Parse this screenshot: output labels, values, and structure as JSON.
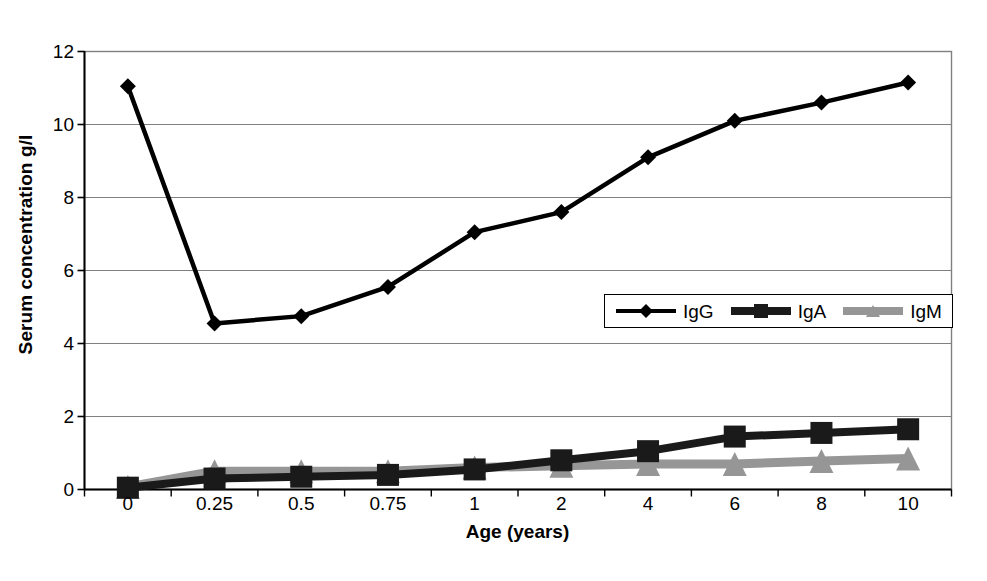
{
  "chart_data": {
    "type": "line",
    "title": "",
    "xlabel": "Age (years)",
    "ylabel": "Serum concentration g/l",
    "categories": [
      "0",
      "0.25",
      "0.5",
      "0.75",
      "1",
      "2",
      "4",
      "6",
      "8",
      "10"
    ],
    "ylim": [
      0,
      12
    ],
    "yticks": [
      "0",
      "2",
      "4",
      "6",
      "8",
      "10",
      "12"
    ],
    "ytick_values": [
      0,
      2,
      4,
      6,
      8,
      10,
      12
    ],
    "grid": "horizontal",
    "legend_position": "inside-center-right",
    "series": [
      {
        "name": "IgG",
        "color": "#000000",
        "marker": "diamond",
        "values": [
          11.05,
          4.55,
          4.75,
          5.55,
          7.05,
          7.6,
          9.1,
          10.1,
          10.6,
          11.15
        ]
      },
      {
        "name": "IgA",
        "color": "#1a1a1a",
        "marker": "square",
        "values": [
          0.05,
          0.3,
          0.35,
          0.4,
          0.55,
          0.8,
          1.05,
          1.45,
          1.55,
          1.65
        ]
      },
      {
        "name": "IgM",
        "color": "#969696",
        "marker": "triangle",
        "values": [
          0.07,
          0.5,
          0.5,
          0.5,
          0.6,
          0.65,
          0.7,
          0.7,
          0.78,
          0.85
        ]
      }
    ]
  },
  "legend": {
    "items": [
      {
        "label": "IgG"
      },
      {
        "label": "IgA"
      },
      {
        "label": "IgM"
      }
    ]
  },
  "colors": {
    "igg": "#000000",
    "iga": "#1a1a1a",
    "igm": "#969696",
    "grid": "#808080",
    "axis": "#000000",
    "background": "#ffffff"
  }
}
